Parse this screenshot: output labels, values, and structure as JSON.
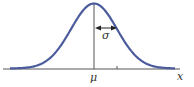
{
  "diagram": {
    "labels": {
      "mean": "μ",
      "std_dev": "σ",
      "x_axis": "x"
    },
    "colors": {
      "curve": "#4b5b9c",
      "axis": "#555555",
      "arrow": "#222222"
    }
  }
}
